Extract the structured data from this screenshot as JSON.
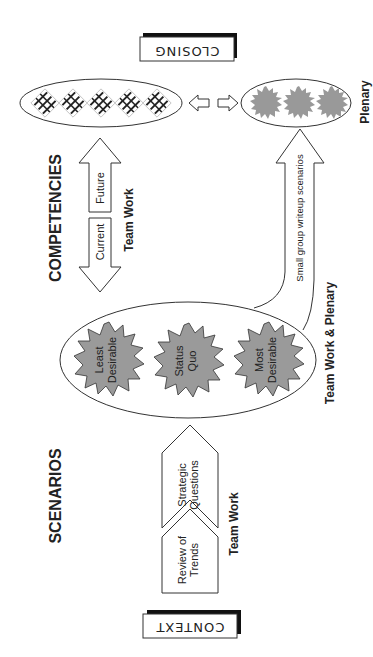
{
  "diagram": {
    "orientation": "rotated-90-ccw",
    "colors": {
      "stroke": "#333333",
      "starburst_fill": "#9a9a9a",
      "plenary_burst_fill": "#999999",
      "background": "#ffffff",
      "shadow": "#111111"
    },
    "stages": {
      "context": {
        "label": "CONTEXT"
      },
      "scenarios": {
        "label": "SCENARIOS",
        "steps": [
          {
            "label_line1": "Review of",
            "label_line2": "Trends"
          },
          {
            "label_line1": "Strategic",
            "label_line2": "Questions"
          }
        ],
        "steps_caption": "Team Work",
        "outcomes": [
          {
            "label_line1": "Least",
            "label_line2": "Desirable"
          },
          {
            "label_line1": "Status",
            "label_line2": "Quo"
          },
          {
            "label_line1": "Most",
            "label_line2": "Desirable"
          }
        ],
        "outcomes_caption": "Team Work & Plenary",
        "writeup_arrow_label": "Small group writeup scenarios"
      },
      "competencies": {
        "label": "COMPETENCIES",
        "arrow_future": "Future",
        "arrow_current": "Current",
        "caption": "Team Work"
      },
      "closing": {
        "label": "CLOSING",
        "plenary_caption": "Plenary",
        "competency_icon_count": 5,
        "plenary_burst_count": 3
      }
    }
  }
}
